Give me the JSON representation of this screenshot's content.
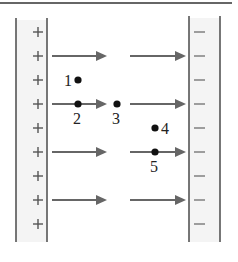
{
  "figure": {
    "left_plate": {
      "charge_sign": "+",
      "sign_count": 9
    },
    "right_plate": {
      "charge_sign": "−",
      "sign_count": 9
    },
    "field_lines": {
      "count": 4,
      "direction": "left-to-right"
    },
    "points": [
      {
        "label": "1",
        "x": 78,
        "y": 80,
        "label_x": 64,
        "label_y": 86,
        "label_pos": "left"
      },
      {
        "label": "2",
        "x": 78,
        "y": 104,
        "label_x": 73,
        "label_y": 124,
        "label_pos": "below"
      },
      {
        "label": "3",
        "x": 117,
        "y": 104,
        "label_x": 112,
        "label_y": 124,
        "label_pos": "below"
      },
      {
        "label": "4",
        "x": 155,
        "y": 128,
        "label_x": 161,
        "label_y": 134,
        "label_pos": "right"
      },
      {
        "label": "5",
        "x": 155,
        "y": 152,
        "label_x": 150,
        "label_y": 172,
        "label_pos": "below"
      }
    ],
    "colors": {
      "plate_fill": "#f4f4f4",
      "plate_line": "#555555",
      "arrow": "#666666",
      "dot": "#111111"
    }
  }
}
